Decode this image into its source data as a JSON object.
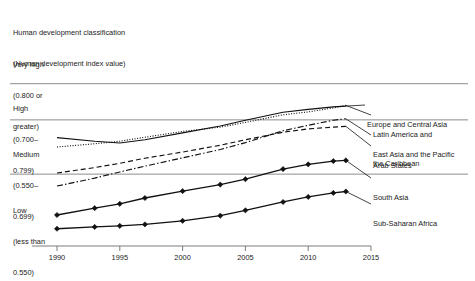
{
  "header": {
    "line1": "Human development classification",
    "line2": "(Human development index value)"
  },
  "classifications": [
    {
      "name": "very-high",
      "line1": "Very high",
      "line2": "(0.800 or",
      "line3": "greater)",
      "threshold": 0.8
    },
    {
      "name": "high",
      "line1": "High",
      "line2": "(0.700–",
      "line3": "0.799)",
      "threshold": 0.7
    },
    {
      "name": "medium",
      "line1": "Medium",
      "line2": "(0.550–",
      "line3": "0.699)",
      "threshold": 0.55
    },
    {
      "name": "low",
      "line1": "Low",
      "line2": "(less than",
      "line3": "0.550)",
      "threshold": null
    }
  ],
  "chart_data": {
    "type": "line",
    "title": "Human development classification (Human development index value)",
    "xlabel": "",
    "ylabel": "Human development index value",
    "xlim": [
      1990,
      2015
    ],
    "ylim": [
      0.39,
      0.86
    ],
    "xticks": [
      1990,
      1995,
      2000,
      2005,
      2010,
      2015
    ],
    "xticklabels": [
      "1990",
      "1995",
      "2000",
      "2005",
      "2010",
      "2015"
    ],
    "gridlines": [
      {
        "value": 0.8,
        "label": "0.800"
      },
      {
        "value": 0.7,
        "label": "0.700"
      },
      {
        "value": 0.55,
        "label": "0.550"
      }
    ],
    "grid": true,
    "legend": "right-inline",
    "series": [
      {
        "name": "Europe and Central Asia",
        "label": "Europe and Central Asia",
        "style": "solid",
        "markers": false,
        "x": [
          1990,
          1993,
          1995,
          1997,
          2000,
          2003,
          2005,
          2008,
          2010,
          2012,
          2013
        ],
        "values": [
          0.651,
          0.641,
          0.636,
          0.645,
          0.664,
          0.683,
          0.699,
          0.721,
          0.729,
          0.736,
          0.738
        ]
      },
      {
        "name": "Latin America and the Caribbean",
        "label": "Latin America and\nthe Caribbean",
        "label_line1": "Latin America and",
        "label_line2": "the Caribbean",
        "style": "dotted",
        "markers": false,
        "x": [
          1990,
          1993,
          1995,
          1997,
          2000,
          2003,
          2005,
          2008,
          2010,
          2012,
          2013
        ],
        "values": [
          0.625,
          0.634,
          0.641,
          0.652,
          0.668,
          0.68,
          0.693,
          0.714,
          0.722,
          0.733,
          0.74
        ]
      },
      {
        "name": "East Asia and the Pacific",
        "label": "East Asia and the Pacific",
        "style": "dashdot",
        "markers": false,
        "x": [
          1990,
          1993,
          1995,
          1997,
          2000,
          2003,
          2005,
          2008,
          2010,
          2012,
          2013
        ],
        "values": [
          0.517,
          0.539,
          0.556,
          0.572,
          0.595,
          0.618,
          0.637,
          0.67,
          0.685,
          0.699,
          0.703
        ]
      },
      {
        "name": "Arab States",
        "label": "Arab States",
        "style": "dashed",
        "markers": false,
        "x": [
          1990,
          1993,
          1995,
          1997,
          2000,
          2003,
          2005,
          2008,
          2010,
          2012,
          2013
        ],
        "values": [
          0.553,
          0.568,
          0.58,
          0.594,
          0.611,
          0.63,
          0.645,
          0.666,
          0.675,
          0.68,
          0.682
        ]
      },
      {
        "name": "South Asia",
        "label": "South Asia",
        "style": "solid",
        "markers": true,
        "x": [
          1990,
          1993,
          1995,
          1997,
          2000,
          2003,
          2005,
          2008,
          2010,
          2012,
          2013
        ],
        "values": [
          0.437,
          0.456,
          0.468,
          0.484,
          0.503,
          0.521,
          0.536,
          0.564,
          0.577,
          0.586,
          0.588
        ]
      },
      {
        "name": "Sub-Saharan Africa",
        "label": "Sub-Saharan Africa",
        "style": "solid",
        "markers": true,
        "x": [
          1990,
          1993,
          1995,
          1997,
          2000,
          2003,
          2005,
          2008,
          2010,
          2012,
          2013
        ],
        "values": [
          0.399,
          0.404,
          0.407,
          0.411,
          0.421,
          0.435,
          0.45,
          0.473,
          0.487,
          0.498,
          0.502
        ]
      }
    ]
  }
}
